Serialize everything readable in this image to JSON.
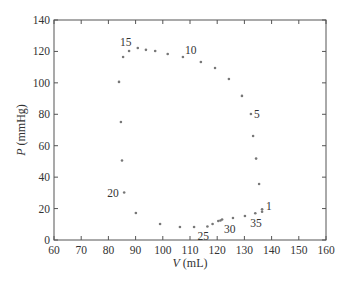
{
  "chart_data": {
    "type": "scatter",
    "title": "",
    "xlabel": "V (mL)",
    "ylabel": "P (mmHg)",
    "xlabel_var": "V",
    "xlabel_unit": " (mL)",
    "ylabel_var": "P",
    "ylabel_unit": " (mmHg)",
    "xlim": [
      60,
      160
    ],
    "ylim": [
      0,
      140
    ],
    "xticks": [
      60,
      70,
      80,
      90,
      100,
      110,
      120,
      130,
      140,
      150,
      160
    ],
    "yticks": [
      0,
      20,
      40,
      60,
      80,
      100,
      120,
      140
    ],
    "grid": false,
    "legend": null,
    "marker_color": "#777777",
    "series": [
      {
        "name": "pressure-volume loop",
        "points": [
          {
            "V": 136.5,
            "P": 19.5
          },
          {
            "V": 135.4,
            "P": 35.6
          },
          {
            "V": 134.3,
            "P": 51.8
          },
          {
            "V": 133.2,
            "P": 66.2
          },
          {
            "V": 132.4,
            "P": 80.2
          },
          {
            "V": 129.1,
            "P": 91.7
          },
          {
            "V": 124.3,
            "P": 102.5
          },
          {
            "V": 119.2,
            "P": 109.5
          },
          {
            "V": 114.0,
            "P": 113.3
          },
          {
            "V": 107.4,
            "P": 116.5
          },
          {
            "V": 101.8,
            "P": 118.4
          },
          {
            "V": 97.2,
            "P": 120.3
          },
          {
            "V": 93.8,
            "P": 121.0
          },
          {
            "V": 90.8,
            "P": 122.2
          },
          {
            "V": 87.6,
            "P": 120.3
          },
          {
            "V": 85.4,
            "P": 116.5
          },
          {
            "V": 83.9,
            "P": 100.6
          },
          {
            "V": 84.6,
            "P": 75.1
          },
          {
            "V": 85.0,
            "P": 50.6
          },
          {
            "V": 85.8,
            "P": 30.2
          },
          {
            "V": 90.1,
            "P": 17.2
          },
          {
            "V": 99.0,
            "P": 10.2
          },
          {
            "V": 106.3,
            "P": 8.3
          },
          {
            "V": 111.5,
            "P": 8.3
          },
          {
            "V": 116.4,
            "P": 8.6
          },
          {
            "V": 118.3,
            "P": 10.2
          },
          {
            "V": 120.4,
            "P": 12.1
          },
          {
            "V": 121.2,
            "P": 12.4
          },
          {
            "V": 121.8,
            "P": 13.0
          },
          {
            "V": 125.8,
            "P": 14.0
          },
          {
            "V": 130.2,
            "P": 15.3
          },
          {
            "V": 134.0,
            "P": 17.0
          },
          {
            "V": 136.5,
            "P": 18.0
          }
        ]
      }
    ],
    "annotations": [
      {
        "text": "1",
        "V": 136.5,
        "P": 19.5,
        "dx": 4,
        "dy": 1
      },
      {
        "text": "5",
        "V": 132.4,
        "P": 80.2,
        "dx": 3,
        "dy": 4
      },
      {
        "text": "10",
        "V": 107.4,
        "P": 116.5,
        "dx": 2,
        "dy": -3
      },
      {
        "text": "15",
        "V": 87.6,
        "P": 120.3,
        "dx": -9,
        "dy": -5
      },
      {
        "text": "20",
        "V": 85.8,
        "P": 30.2,
        "dx": -17,
        "dy": 4
      },
      {
        "text": "25",
        "V": 116.4,
        "P": 8.6,
        "dx": -10,
        "dy": 14
      },
      {
        "text": "30",
        "V": 121.8,
        "P": 13.0,
        "dx": 2,
        "dy": 13
      },
      {
        "text": "35",
        "V": 134.0,
        "P": 17.0,
        "dx": -5,
        "dy": 14
      }
    ]
  }
}
